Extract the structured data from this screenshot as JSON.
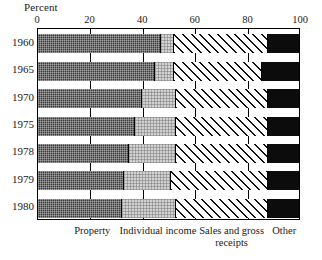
{
  "chart_data": {
    "type": "bar",
    "orientation": "horizontal",
    "stacked": true,
    "normalized": true,
    "title": "",
    "xlabel": "Percent",
    "ylabel": "",
    "xlim": [
      0,
      100
    ],
    "xticks": [
      0,
      20,
      40,
      60,
      80,
      100
    ],
    "xtick_labels": [
      "0",
      "20",
      "40",
      "60",
      "80",
      "100"
    ],
    "grid": true,
    "legend_position": "below-axis",
    "categories": [
      "1960",
      "1965",
      "1970",
      "1975",
      "1978",
      "1979",
      "1980"
    ],
    "series": [
      {
        "name": "Property",
        "values": [
          47,
          45,
          40,
          37,
          35,
          33,
          32
        ],
        "fill": "fill-property"
      },
      {
        "name": "Individual income",
        "values": [
          5,
          7,
          13,
          16,
          18,
          18,
          21
        ],
        "fill": "fill-individual"
      },
      {
        "name": "Sales and gross receipts",
        "values": [
          36,
          34,
          35,
          35,
          35,
          37,
          35
        ],
        "fill": "fill-sales"
      },
      {
        "name": "Other",
        "values": [
          12,
          14,
          12,
          12,
          12,
          12,
          12
        ],
        "fill": "fill-other"
      }
    ],
    "series_labels": [
      {
        "text_line1": "Property",
        "text_line2": "",
        "x_pct": 21
      },
      {
        "text_line1": "Individual income",
        "text_line2": "",
        "x_pct": 46
      },
      {
        "text_line1": "Sales and gross",
        "text_line2": "receipts",
        "x_pct": 74
      },
      {
        "text_line1": "Other",
        "text_line2": "",
        "x_pct": 94
      }
    ]
  },
  "axis": {
    "percent_label": "Percent"
  }
}
